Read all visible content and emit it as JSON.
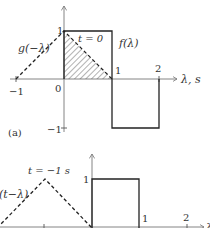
{
  "panel_a": {
    "label": "(a)",
    "func_f": "f(λ)",
    "func_g": "g(−λ)",
    "time_label": "t = 0",
    "axis_label": "λ, s",
    "ticks_x": {
      "neg1": "−1",
      "zero": "0",
      "one": "1",
      "two": "2"
    },
    "ticks_y": {
      "one": "1",
      "neg1": "−1"
    }
  },
  "panel_b": {
    "func_g": "g(t−λ)",
    "time_label": "t = −1 s",
    "ticks_x": {
      "one": "1",
      "two": "2"
    },
    "ticks_y": {
      "one": "1"
    },
    "axis_label": "λ"
  },
  "colors": {
    "line": "#222222",
    "axis": "#777777",
    "hatch": "#555555"
  }
}
